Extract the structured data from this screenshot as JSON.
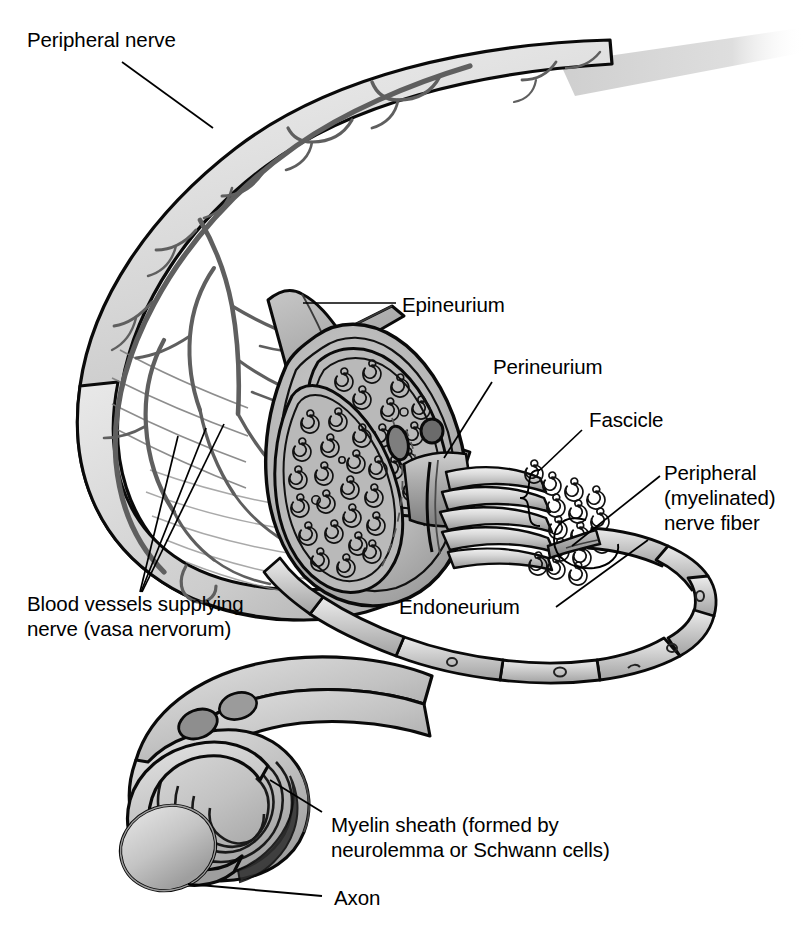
{
  "figure": {
    "background_color": "#ffffff",
    "width": 810,
    "height": 928
  },
  "labels": {
    "peripheral_nerve": "Peripheral nerve",
    "epineurium": "Epineurium",
    "perineurium": "Perineurium",
    "fascicle": "Fascicle",
    "peripheral_nerve_fiber": "Peripheral\n(myelinated)\nnerve fiber",
    "endoneurium": "Endoneurium",
    "blood_vessels": "Blood vessels supplying\nnerve (vasa nervorum)",
    "myelin_sheath": "Myelin sheath (formed by\nneurolemma or Schwann cells)",
    "axon": "Axon"
  },
  "palette": {
    "outline": "#000000",
    "light_fill": "#dcdcdc",
    "mid_fill": "#bdbdbd",
    "dark_fill": "#9a9a9a",
    "darker_fill": "#7d7d7d",
    "vessel": "#6e6e6e",
    "white": "#ffffff",
    "leader_line": "#000000"
  },
  "structures": [
    {
      "name": "nerve-trunk",
      "description": "Large curved peripheral nerve trunk tapering to upper right"
    },
    {
      "name": "vasa-nervorum",
      "description": "Branching blood vessels on the epineurial surface"
    },
    {
      "name": "cut-cross-section",
      "description": "Transverse cut face showing two fascicles"
    },
    {
      "name": "fascicle-a",
      "description": "Upper fascicle with myelinated nerve fibers in cross section"
    },
    {
      "name": "fascicle-b",
      "description": "Lower larger fascicle with myelinated nerve fibers"
    },
    {
      "name": "epineurium-flap",
      "description": "Peeled-back epineurium sheet at the cut end"
    },
    {
      "name": "fascicle-bundle",
      "description": "Extracted fascicle drawn out to the right showing packed fibers"
    },
    {
      "name": "single-nerve-fiber",
      "description": "Single myelinated fiber looping down with nodes of Ranvier"
    },
    {
      "name": "myelin-cutaway",
      "description": "Enlarged fiber with spiral myelin lamellae cut open around the axon"
    },
    {
      "name": "axon-core",
      "description": "Cylindrical axon core exposed at the cut end"
    }
  ]
}
